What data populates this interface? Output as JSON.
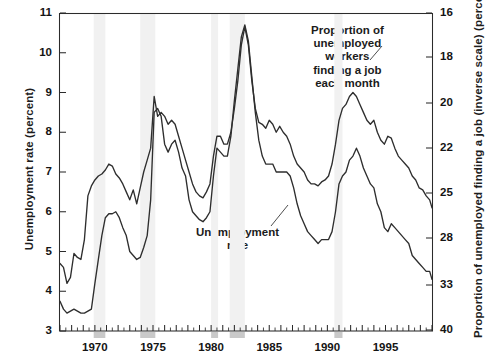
{
  "chart_data": {
    "type": "line",
    "title": "",
    "xlabel": "",
    "ylabel": "Unemployment rate (percent)",
    "y2label": "Proportion of unemployed finding a job (inverse scale) (percent)",
    "grid": false,
    "legend": "annotations-inline",
    "xlim": [
      1967.0,
      1999.0
    ],
    "ylim": [
      3,
      11
    ],
    "y_ticks": [
      3,
      4,
      5,
      6,
      7,
      8,
      9,
      10,
      11
    ],
    "x_ticks": [
      1970,
      1975,
      1980,
      1985,
      1990,
      1995
    ],
    "x_tick_labels": [
      "1970",
      "1975",
      "1980",
      "1985",
      "1990",
      "1995"
    ],
    "y2_ticks": [
      16,
      18,
      20,
      22,
      25,
      28,
      33,
      40
    ],
    "y2_tick_labels": [
      "16",
      "18",
      "20",
      "22",
      "25",
      "28",
      "33",
      "40"
    ],
    "y2_inverse": true,
    "annotations": [
      {
        "name": "proportion-finding-job-label",
        "lines": [
          "Proportion of",
          "unemployed",
          "workers",
          "finding a job",
          "each month"
        ],
        "text": "Proportion of unemployed workers finding a job each month"
      },
      {
        "name": "unemployment-rate-label",
        "lines": [
          "Unemployment",
          "rate"
        ],
        "text": "Unemployment rate"
      }
    ],
    "shaded_regions": {
      "name": "recession-bands",
      "color": "#f1f1f1",
      "ranges": [
        [
          1969.9,
          1970.9
        ],
        [
          1973.9,
          1975.2
        ],
        [
          1980.0,
          1980.6
        ],
        [
          1981.6,
          1982.9
        ],
        [
          1990.6,
          1991.3
        ]
      ]
    },
    "series": [
      {
        "name": "Unemployment rate",
        "axis": "left",
        "units": "percent",
        "x": [
          1967.0,
          1967.3,
          1967.6,
          1967.9,
          1968.2,
          1968.5,
          1968.8,
          1969.1,
          1969.4,
          1969.7,
          1970.0,
          1970.3,
          1970.6,
          1970.9,
          1971.2,
          1971.5,
          1971.8,
          1972.1,
          1972.4,
          1972.7,
          1973.0,
          1973.3,
          1973.6,
          1973.9,
          1974.2,
          1974.5,
          1974.8,
          1975.1,
          1975.4,
          1975.7,
          1976.0,
          1976.3,
          1976.6,
          1976.9,
          1977.2,
          1977.5,
          1977.8,
          1978.1,
          1978.4,
          1978.7,
          1979.0,
          1979.3,
          1979.6,
          1979.9,
          1980.2,
          1980.5,
          1980.8,
          1981.1,
          1981.4,
          1981.7,
          1982.0,
          1982.3,
          1982.6,
          1982.9,
          1983.2,
          1983.5,
          1983.8,
          1984.1,
          1984.4,
          1984.7,
          1985.0,
          1985.3,
          1985.6,
          1985.9,
          1986.2,
          1986.5,
          1986.8,
          1987.1,
          1987.4,
          1987.7,
          1988.0,
          1988.3,
          1988.6,
          1988.9,
          1989.2,
          1989.5,
          1989.8,
          1990.1,
          1990.4,
          1990.7,
          1991.0,
          1991.3,
          1991.6,
          1991.9,
          1992.2,
          1992.5,
          1992.8,
          1993.1,
          1993.4,
          1993.7,
          1994.0,
          1994.3,
          1994.6,
          1994.9,
          1995.2,
          1995.5,
          1995.8,
          1996.1,
          1996.4,
          1996.7,
          1997.0,
          1997.3,
          1997.6,
          1997.9,
          1998.2,
          1998.5,
          1998.8,
          1999.0
        ],
        "y": [
          3.75,
          3.55,
          3.45,
          3.5,
          3.55,
          3.5,
          3.45,
          3.45,
          3.5,
          3.55,
          4.2,
          4.8,
          5.4,
          5.85,
          5.95,
          5.95,
          6.0,
          5.85,
          5.6,
          5.4,
          5.0,
          4.9,
          4.8,
          4.85,
          5.1,
          5.4,
          6.3,
          8.5,
          8.6,
          8.4,
          7.7,
          7.5,
          7.7,
          7.8,
          7.5,
          7.1,
          6.9,
          6.3,
          6.0,
          5.9,
          5.8,
          5.75,
          5.85,
          6.0,
          6.9,
          7.6,
          7.5,
          7.4,
          7.4,
          7.9,
          8.8,
          9.6,
          10.4,
          10.7,
          10.3,
          9.4,
          8.5,
          7.8,
          7.4,
          7.2,
          7.2,
          7.2,
          7.0,
          7.0,
          7.0,
          7.0,
          6.9,
          6.6,
          6.2,
          5.9,
          5.7,
          5.5,
          5.4,
          5.3,
          5.2,
          5.3,
          5.3,
          5.3,
          5.5,
          6.0,
          6.7,
          6.9,
          7.0,
          7.3,
          7.4,
          7.6,
          7.4,
          7.1,
          6.9,
          6.7,
          6.6,
          6.2,
          6.0,
          5.6,
          5.5,
          5.7,
          5.6,
          5.5,
          5.4,
          5.3,
          5.2,
          4.9,
          4.8,
          4.7,
          4.6,
          4.5,
          4.5,
          4.3
        ]
      },
      {
        "name": "Proportion of unemployed workers finding a job each month",
        "axis": "right",
        "units": "percent",
        "inverse_scale": true,
        "x": [
          1967.0,
          1967.3,
          1967.6,
          1967.9,
          1968.2,
          1968.5,
          1968.8,
          1969.1,
          1969.4,
          1969.7,
          1970.0,
          1970.3,
          1970.6,
          1970.9,
          1971.2,
          1971.5,
          1971.8,
          1972.1,
          1972.4,
          1972.7,
          1973.0,
          1973.3,
          1973.6,
          1973.9,
          1974.2,
          1974.5,
          1974.8,
          1975.1,
          1975.4,
          1975.7,
          1976.0,
          1976.3,
          1976.6,
          1976.9,
          1977.2,
          1977.5,
          1977.8,
          1978.1,
          1978.4,
          1978.7,
          1979.0,
          1979.3,
          1979.6,
          1979.9,
          1980.2,
          1980.5,
          1980.8,
          1981.1,
          1981.4,
          1981.7,
          1982.0,
          1982.3,
          1982.6,
          1982.9,
          1983.2,
          1983.5,
          1983.8,
          1984.1,
          1984.4,
          1984.7,
          1985.0,
          1985.3,
          1985.6,
          1985.9,
          1986.2,
          1986.5,
          1986.8,
          1987.1,
          1987.4,
          1987.7,
          1988.0,
          1988.3,
          1988.6,
          1988.9,
          1989.2,
          1989.5,
          1989.8,
          1990.1,
          1990.4,
          1990.7,
          1991.0,
          1991.3,
          1991.6,
          1991.9,
          1992.2,
          1992.5,
          1992.8,
          1993.1,
          1993.4,
          1993.7,
          1994.0,
          1994.3,
          1994.6,
          1994.9,
          1995.2,
          1995.5,
          1995.8,
          1996.1,
          1996.4,
          1996.7,
          1997.0,
          1997.3,
          1997.6,
          1997.9,
          1998.2,
          1998.5,
          1998.8,
          1999.0
        ],
        "y_left_equiv": [
          4.7,
          4.6,
          4.2,
          4.35,
          4.95,
          4.85,
          4.8,
          5.3,
          6.4,
          6.65,
          6.8,
          6.9,
          6.95,
          7.05,
          7.2,
          7.15,
          6.95,
          6.85,
          6.7,
          6.5,
          6.3,
          6.55,
          6.2,
          6.6,
          7.0,
          7.3,
          7.6,
          8.9,
          8.4,
          8.5,
          8.4,
          8.2,
          8.3,
          8.2,
          7.9,
          7.6,
          7.3,
          7.0,
          6.7,
          6.5,
          6.4,
          6.35,
          6.5,
          6.7,
          7.4,
          7.9,
          7.9,
          7.7,
          7.7,
          8.0,
          8.6,
          9.3,
          10.2,
          10.65,
          10.2,
          9.3,
          8.6,
          8.25,
          8.2,
          8.1,
          8.3,
          8.2,
          8.0,
          8.15,
          8.0,
          7.9,
          7.7,
          7.4,
          7.2,
          7.1,
          7.0,
          6.8,
          6.7,
          6.7,
          6.65,
          6.75,
          6.8,
          6.9,
          7.2,
          7.7,
          8.3,
          8.6,
          8.7,
          8.9,
          9.0,
          8.9,
          8.7,
          8.5,
          8.3,
          8.2,
          8.3,
          8.0,
          7.8,
          7.7,
          7.9,
          7.85,
          7.6,
          7.4,
          7.3,
          7.2,
          7.1,
          6.9,
          6.8,
          6.6,
          6.55,
          6.4,
          6.3,
          6.1
        ],
        "approx_right_values": [
          26.0,
          25.6,
          24.0,
          24.5,
          27.0,
          26.6,
          26.4,
          28.0,
          31.2,
          31.8,
          32.0,
          32.3,
          32.4,
          32.7,
          33.0,
          32.9,
          32.4,
          32.1,
          31.7,
          31.1,
          30.5,
          31.3,
          30.3,
          31.4,
          32.4,
          33.1,
          33.7,
          36.0,
          35.0,
          35.2,
          35.0,
          34.6,
          34.8,
          34.6,
          34.0,
          33.3,
          32.6,
          31.8,
          31.0,
          30.4,
          30.1,
          30.0,
          30.4,
          31.0,
          32.8,
          33.8,
          33.8,
          33.4,
          33.4,
          34.0,
          35.3,
          36.6,
          38.2,
          39.0,
          38.2,
          36.6,
          35.3,
          34.6,
          34.5,
          34.3,
          34.7,
          34.5,
          34.1,
          34.4,
          34.1,
          33.9,
          33.5,
          32.8,
          32.3,
          32.0,
          31.8,
          31.2,
          30.9,
          30.9,
          30.8,
          31.1,
          31.2,
          31.5,
          32.3,
          33.5,
          35.1,
          35.7,
          35.9,
          36.4,
          36.6,
          36.4,
          35.9,
          35.5,
          35.1,
          34.8,
          35.1,
          34.4,
          33.9,
          33.7,
          34.1,
          34.0,
          33.5,
          33.0,
          32.7,
          32.4,
          32.1,
          31.6,
          31.3,
          30.8,
          30.6,
          30.2,
          29.9,
          29.4
        ]
      }
    ]
  }
}
